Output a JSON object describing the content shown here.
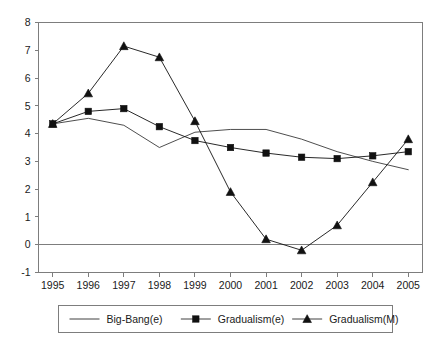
{
  "chart_data": {
    "type": "line",
    "title": "",
    "subtitle": "",
    "xlabel": "",
    "ylabel": "",
    "categories": [
      "1995",
      "1996",
      "1997",
      "1998",
      "1999",
      "2000",
      "2001",
      "2002",
      "2003",
      "2004",
      "2005"
    ],
    "x": [
      1995,
      1996,
      1997,
      1998,
      1999,
      2000,
      2001,
      2002,
      2003,
      2004,
      2005
    ],
    "xlim": [
      1994.6,
      2005.4
    ],
    "ylim": [
      -1,
      8
    ],
    "ytick_labels": [
      "8",
      "7",
      "6",
      "5",
      "4",
      "3",
      "2",
      "1",
      "0",
      "-1"
    ],
    "ytick_values": [
      8,
      7,
      6,
      5,
      4,
      3,
      2,
      1,
      0,
      -1
    ],
    "grid": false,
    "zero_line": true,
    "legend_position": "bottom",
    "series": [
      {
        "name": "Big-Bang(e)",
        "marker": "none",
        "color": "#3a3a3a",
        "values": [
          4.35,
          4.55,
          4.3,
          3.5,
          4.05,
          4.15,
          4.15,
          3.8,
          3.35,
          3.0,
          2.7
        ]
      },
      {
        "name": "Gradualism(e)",
        "marker": "square",
        "color": "#111111",
        "values": [
          4.35,
          4.8,
          4.9,
          4.25,
          3.75,
          3.5,
          3.3,
          3.15,
          3.1,
          3.2,
          3.35
        ]
      },
      {
        "name": "Gradualism(M)",
        "marker": "triangle",
        "color": "#111111",
        "values": [
          4.35,
          5.45,
          7.15,
          6.75,
          4.45,
          1.9,
          0.2,
          -0.2,
          0.7,
          2.25,
          3.8
        ]
      }
    ]
  },
  "legend": {
    "entries": [
      {
        "label": "Big-Bang(e)",
        "marker": "none"
      },
      {
        "label": "Gradualism(e)",
        "marker": "square"
      },
      {
        "label": "Gradualism(M)",
        "marker": "triangle"
      }
    ]
  }
}
